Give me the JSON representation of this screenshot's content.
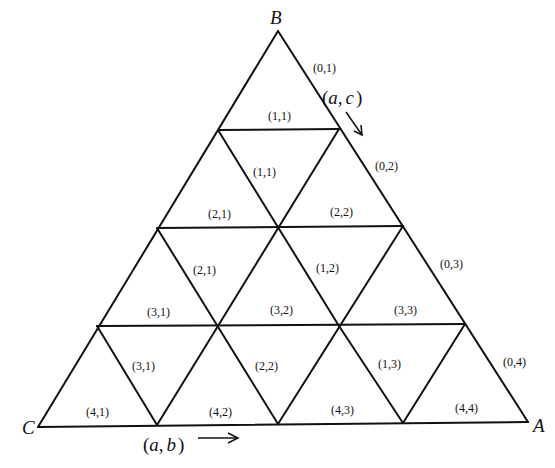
{
  "diagram": {
    "type": "triangular-grid",
    "subdivisions": 4,
    "vertices": {
      "B": {
        "label": "B",
        "x": 278,
        "y": 31
      },
      "C": {
        "label": "C",
        "x": 38,
        "y": 427
      },
      "A": {
        "label": "A",
        "x": 528,
        "y": 422
      }
    },
    "lines": [
      [
        278,
        31,
        38,
        427
      ],
      [
        278,
        31,
        528,
        422
      ],
      [
        38,
        427,
        528,
        422
      ],
      [
        218,
        130,
        339,
        129
      ],
      [
        157,
        228,
        403,
        226
      ],
      [
        97,
        326,
        465,
        324
      ],
      [
        218,
        130,
        339,
        326
      ],
      [
        157,
        228,
        278,
        424
      ],
      [
        97,
        326,
        157,
        425
      ],
      [
        339,
        129,
        218,
        326
      ],
      [
        403,
        226,
        278,
        424
      ],
      [
        465,
        324,
        403,
        423
      ],
      [
        339,
        326,
        403,
        423
      ],
      [
        218,
        326,
        157,
        425
      ]
    ],
    "edge_labels": [
      {
        "id": "b01",
        "text": "(0,1)",
        "x": 313,
        "y": 72
      },
      {
        "id": "b02",
        "text": "(0,2)",
        "x": 375,
        "y": 170
      },
      {
        "id": "b03",
        "text": "(0,3)",
        "x": 440,
        "y": 268
      },
      {
        "id": "b04",
        "text": "(0,4)",
        "x": 503,
        "y": 366
      }
    ],
    "cell_labels": [
      {
        "text": "(1,1)",
        "x": 268,
        "y": 120
      },
      {
        "text": "(1,1)",
        "x": 253,
        "y": 176
      },
      {
        "text": "(2,1)",
        "x": 208,
        "y": 218
      },
      {
        "text": "(2,2)",
        "x": 330,
        "y": 216
      },
      {
        "text": "(2,1)",
        "x": 193,
        "y": 274
      },
      {
        "text": "(1,2)",
        "x": 316,
        "y": 272
      },
      {
        "text": "(3,1)",
        "x": 147,
        "y": 316
      },
      {
        "text": "(3,2)",
        "x": 270,
        "y": 314
      },
      {
        "text": "(3,3)",
        "x": 394,
        "y": 314
      },
      {
        "text": "(3,1)",
        "x": 132,
        "y": 370
      },
      {
        "text": "(2,2)",
        "x": 255,
        "y": 370
      },
      {
        "text": "(1,3)",
        "x": 378,
        "y": 368
      },
      {
        "text": "(4,1)",
        "x": 86,
        "y": 416
      },
      {
        "text": "(4,2)",
        "x": 209,
        "y": 416
      },
      {
        "text": "(4,3)",
        "x": 331,
        "y": 414
      },
      {
        "text": "(4,4)",
        "x": 455,
        "y": 412
      }
    ],
    "axis_annotations": {
      "ac": {
        "open": "(",
        "a": "a",
        "sep": ",",
        "c": "c",
        "close": ")",
        "x": 322,
        "y": 104
      },
      "ab": {
        "open": "(",
        "a": "a",
        "sep": ",",
        "b": "b",
        "close": ")",
        "x": 143,
        "y": 451
      }
    }
  }
}
